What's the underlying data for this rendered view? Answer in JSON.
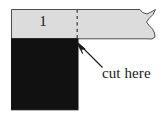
{
  "figure": {
    "background_color": "#ffffff",
    "strip": {
      "fill_color": "#dcdcdc",
      "stroke_color": "#555555",
      "left": 11,
      "top": 9,
      "right": 156,
      "bottom": 39,
      "torn_right_edge": true
    },
    "square": {
      "fill_color": "#111111",
      "left": 11,
      "top": 39,
      "right": 78,
      "bottom": 110
    },
    "cut_line": {
      "x": 77,
      "top": 9,
      "bottom": 39,
      "style": "dashed",
      "color": "#4d4d4d"
    },
    "piece_label": "1",
    "annotation_label": "cut here",
    "arrow": {
      "tail_x": 103,
      "tail_y": 68,
      "tip_x": 76,
      "tip_y": 41,
      "color": "#1a1a1a"
    }
  }
}
